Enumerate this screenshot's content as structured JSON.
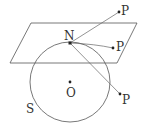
{
  "diagram": {
    "plane": {
      "points": "31,23 137,23 117,63 10,63"
    },
    "sphere": {
      "label": "S",
      "cx": 70,
      "cy": 82,
      "r": 40
    },
    "center": {
      "label": "O",
      "x": 70,
      "y": 82
    },
    "pole": {
      "label": "N",
      "x": 70,
      "y": 43
    },
    "points": [
      {
        "label": "P",
        "x": 119,
        "y": 12
      },
      {
        "label": "P",
        "x": 113,
        "y": 48
      },
      {
        "label": "P",
        "x": 120,
        "y": 94
      }
    ]
  }
}
